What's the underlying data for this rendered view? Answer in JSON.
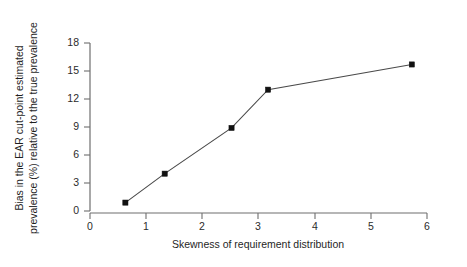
{
  "chart_data": {
    "type": "line",
    "title": "",
    "subtitle": "",
    "xlabel": "Skewness of requirement distribution",
    "ylabel": "Bias in the EAR cut-point estimated prevalence (%) relative to the true prevalence",
    "ylabel_line1": "Bias in the EAR cut-point estimated",
    "ylabel_line2": "prevalence (%) relative to the true prevalence",
    "xlim": [
      0,
      6
    ],
    "ylim": [
      0,
      18
    ],
    "xticks": [
      0,
      1,
      2,
      3,
      4,
      5,
      6
    ],
    "yticks": [
      0,
      3,
      6,
      9,
      12,
      15,
      18
    ],
    "xticklabels": [
      "0",
      "1",
      "2",
      "3",
      "4",
      "5",
      "6"
    ],
    "yticklabels": [
      "0",
      "3",
      "6",
      "9",
      "12",
      "15",
      "18"
    ],
    "grid": false,
    "legend": null,
    "legend_position": "none",
    "marker": "filled-square",
    "line_color": "#4a4a4a",
    "marker_color": "#111111",
    "axis_color": "#6e6e6e",
    "background_color": "#ffffff",
    "x": [
      0.63,
      1.33,
      2.52,
      3.17,
      5.73
    ],
    "values": [
      0.9,
      4.0,
      8.9,
      13.0,
      15.7
    ],
    "points": [
      {
        "x": 0.63,
        "y": 0.9
      },
      {
        "x": 1.33,
        "y": 4.0
      },
      {
        "x": 2.52,
        "y": 8.9
      },
      {
        "x": 3.17,
        "y": 13.0
      },
      {
        "x": 5.73,
        "y": 15.7
      }
    ]
  }
}
